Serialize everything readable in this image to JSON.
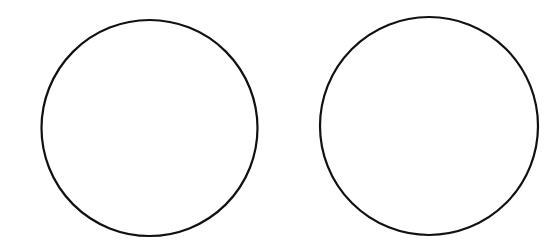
{
  "diagram": {
    "width": 552,
    "height": 247,
    "background": "#ffffff",
    "stroke_color": "#111111",
    "stroke_width": 2.2,
    "shapes": [
      {
        "type": "circle",
        "label": "",
        "cx": 149.5,
        "cy": 128,
        "r": 108
      },
      {
        "type": "circle",
        "label": "",
        "cx": 429,
        "cy": 126,
        "r": 109
      }
    ]
  }
}
